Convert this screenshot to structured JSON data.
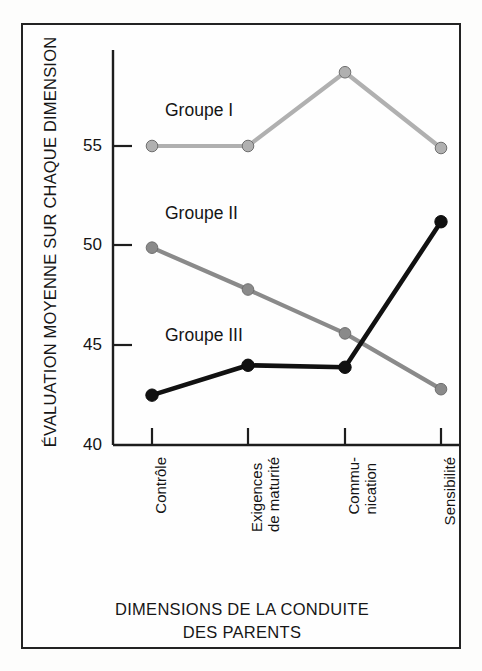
{
  "chart_data": {
    "type": "line",
    "title": "",
    "xlabel": "DIMENSIONS DE LA CONDUITE DES PARENTS",
    "ylabel": "ÉVALUATION MOYENNE SUR CHAQUE DIMENSION",
    "categories": [
      "Contrôle",
      "Exigences de maturité",
      "Commu- nication",
      "Sensibilité"
    ],
    "category_lines": [
      [
        "Contrôle"
      ],
      [
        "Exigences",
        "de maturité"
      ],
      [
        "Commu-",
        "nication"
      ],
      [
        "Sensibilité"
      ]
    ],
    "ylim": [
      40,
      59.5
    ],
    "yticks": [
      40,
      45,
      50,
      55
    ],
    "ytick_labels": [
      "40",
      "45",
      "50",
      "55"
    ],
    "grid": false,
    "legend_position": "inline-labels",
    "series": [
      {
        "name": "Groupe I",
        "color": "#b0b0b0",
        "values": [
          55.0,
          55.0,
          58.7,
          54.9
        ]
      },
      {
        "name": "Groupe II",
        "color": "#8a8a8a",
        "values": [
          49.9,
          47.8,
          45.6,
          42.8
        ]
      },
      {
        "name": "Groupe III",
        "color": "#111111",
        "values": [
          42.5,
          44.0,
          43.9,
          51.2
        ]
      }
    ]
  },
  "labels": {
    "groupe_i": "Groupe I",
    "groupe_ii": "Groupe II",
    "groupe_iii": "Groupe III",
    "y_axis_title": "ÉVALUATION MOYENNE SUR CHAQUE DIMENSION",
    "x_axis_title_line1": "DIMENSIONS DE LA CONDUITE",
    "x_axis_title_line2": "DES PARENTS"
  },
  "ytick_values": {
    "t55": "55",
    "t50": "50",
    "t45": "45",
    "t40": "40"
  },
  "xtick_values": {
    "c1l1": "Contrôle",
    "c2l1": "Exigences",
    "c2l2": "de maturité",
    "c3l1": "Commu-",
    "c3l2": "nication",
    "c4l1": "Sensibilité"
  }
}
